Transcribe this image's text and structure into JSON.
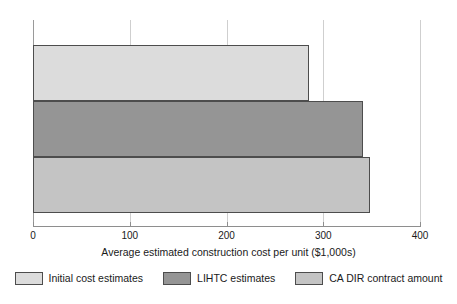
{
  "chart_data": {
    "type": "bar",
    "orientation": "horizontal",
    "title": "",
    "subtitle": "",
    "xlabel": "Average estimated construction cost per unit ($1,000s)",
    "ylabel": "",
    "xlim": [
      0,
      400
    ],
    "xticks": [
      0,
      100,
      200,
      300,
      400
    ],
    "xticklabels": [
      "0",
      "100",
      "200",
      "300",
      "400"
    ],
    "grid": true,
    "grid_axis": "x",
    "legend_position": "bottom",
    "categories": [
      "Initial cost estimates",
      "LIHTC estimates",
      "CA DIR contract amount"
    ],
    "values": [
      285,
      341,
      348
    ],
    "series": [
      {
        "name": "Initial cost estimates",
        "value": 285,
        "color": "#dcdcdc"
      },
      {
        "name": "LIHTC estimates",
        "value": 341,
        "color": "#959595"
      },
      {
        "name": "CA DIR contract amount",
        "value": 348,
        "color": "#c4c4c4"
      }
    ]
  },
  "legend": {
    "items": [
      {
        "label": "Initial cost estimates",
        "color": "#dcdcdc"
      },
      {
        "label": "LIHTC estimates",
        "color": "#959595"
      },
      {
        "label": "CA DIR contract amount",
        "color": "#c4c4c4"
      }
    ]
  },
  "colors": {
    "background": "#ffffff",
    "gridline": "#cfcfcf",
    "axis": "#8e8e8e",
    "bar_outline": "#4d4d4d",
    "text": "#1a1a1a"
  }
}
